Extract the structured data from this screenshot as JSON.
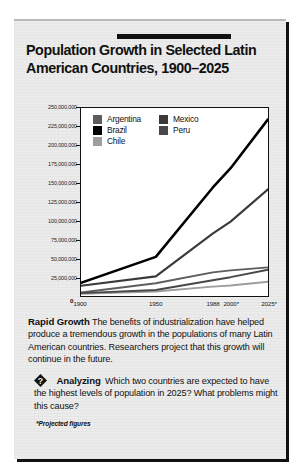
{
  "box": {
    "title": "Population Growth in Selected Latin American Countries, 1900–2025"
  },
  "body": {
    "lead": "Rapid Growth",
    "text": "The benefits of industrialization have helped produce a tremendous growth in the populations of many Latin American countries. Researchers project that this growth will continue in the future."
  },
  "analyzing": {
    "icon": "question-diamond-icon",
    "lead": "Analyzing",
    "text": "Which two countries are expected to have the highest levels of population in 2025? What problems might this cause?"
  },
  "footnote": "*Projected figures",
  "chart_data": {
    "type": "line",
    "title": "Population Growth in Selected Latin American Countries, 1900–2025",
    "xlabel": "",
    "ylabel": "",
    "x": [
      "1900",
      "1950",
      "1988",
      "2000*",
      "2025*"
    ],
    "xtick_labels": [
      "1900",
      "1950",
      "1988",
      "2000*",
      "2025*"
    ],
    "ytick_labels": [
      "0",
      "25,000,000",
      "50,000,000",
      "75,000,000",
      "100,000,000",
      "125,000,000",
      "150,000,000",
      "175,000,000",
      "200,000,000",
      "225,000,000",
      "250,000,000"
    ],
    "ylim": [
      0,
      250000000
    ],
    "ytick_step": 25000000,
    "grid": false,
    "legend_position": "inside-top-left",
    "series": [
      {
        "name": "Argentina",
        "color": "#5d5d5d",
        "values": [
          4700000,
          17000000,
          31500000,
          34000000,
          38000000
        ]
      },
      {
        "name": "Brazil",
        "color": "#000000",
        "values": [
          17500000,
          52000000,
          144000000,
          170000000,
          235000000
        ]
      },
      {
        "name": "Chile",
        "color": "#9e9e9e",
        "values": [
          3000000,
          6000000,
          12500000,
          14000000,
          19000000
        ]
      },
      {
        "name": "Mexico",
        "color": "#3a3a3a",
        "values": [
          13600000,
          26000000,
          83000000,
          99000000,
          142000000
        ]
      },
      {
        "name": "Peru",
        "color": "#484848",
        "values": [
          3800000,
          8000000,
          21000000,
          25000000,
          35000000
        ]
      }
    ]
  }
}
